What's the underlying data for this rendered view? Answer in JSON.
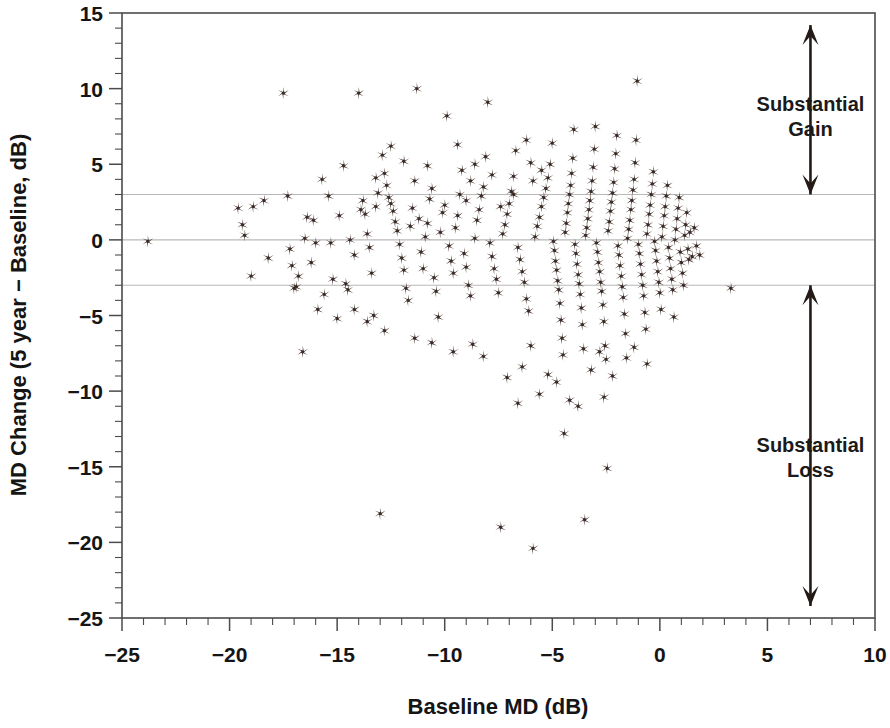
{
  "axes": {
    "x_label": "Baseline MD (dB)",
    "y_label": "MD Change (5 year − Baseline, dB)",
    "x_ticks": [
      "−25",
      "−20",
      "−15",
      "−10",
      "−5",
      "0",
      "5",
      "10"
    ],
    "y_ticks": [
      "15",
      "10",
      "5",
      "0",
      "−5",
      "−10",
      "−15",
      "−20",
      "−25"
    ]
  },
  "annotations": {
    "gain_line1": "Substantial",
    "gain_line2": "Gain",
    "loss_line1": "Substantial",
    "loss_line2": "Loss"
  },
  "colors": {
    "marker": "#3a2a26",
    "refline": "#b9b9b9",
    "frame": "#4b4b4b",
    "text": "#151515"
  },
  "chart_data": {
    "type": "scatter",
    "title": "",
    "xlabel": "Baseline MD (dB)",
    "ylabel": "MD Change (5 year − Baseline, dB)",
    "xlim": [
      -25,
      10
    ],
    "ylim": [
      -25,
      15
    ],
    "x_major_tick_step": 5,
    "x_minor_tick_step": 1,
    "y_major_tick_step": 5,
    "y_minor_tick_step": 1,
    "grid": false,
    "legend": "none",
    "marker_symbol": "asterisk",
    "marker_color": "#3a2a26",
    "reference_lines": [
      {
        "axis": "y",
        "value": 3,
        "color": "#b9b9b9"
      },
      {
        "axis": "y",
        "value": 0,
        "color": "#b9b9b9"
      },
      {
        "axis": "y",
        "value": -3,
        "color": "#b9b9b9"
      }
    ],
    "annotations": [
      {
        "text": "Substantial Gain",
        "x": 7.0,
        "y": 8.5,
        "arrow": "double",
        "arrow_from_y": 14.2,
        "arrow_to_y": 3.0
      },
      {
        "text": "Substantial Loss",
        "x": 7.0,
        "y": -14.0,
        "arrow": "double",
        "arrow_from_y": -3.0,
        "arrow_to_y": -24.2
      }
    ],
    "points": [
      [
        -23.8,
        -0.1
      ],
      [
        -19.6,
        2.1
      ],
      [
        -19.4,
        1.0
      ],
      [
        -19.3,
        0.3
      ],
      [
        -18.9,
        2.2
      ],
      [
        -18.4,
        2.6
      ],
      [
        -17.5,
        9.7
      ],
      [
        -17.3,
        2.9
      ],
      [
        -17.2,
        -0.6
      ],
      [
        -17.1,
        -1.7
      ],
      [
        -17.0,
        -3.2
      ],
      [
        -16.9,
        -3.1
      ],
      [
        -16.6,
        -7.4
      ],
      [
        -16.5,
        0.1
      ],
      [
        -16.4,
        1.5
      ],
      [
        -16.2,
        -1.5
      ],
      [
        -16.1,
        1.3
      ],
      [
        -16.0,
        -0.2
      ],
      [
        -15.9,
        -4.6
      ],
      [
        -15.7,
        4.0
      ],
      [
        -15.4,
        2.9
      ],
      [
        -15.3,
        -0.2
      ],
      [
        -15.2,
        -2.6
      ],
      [
        -15.0,
        -5.2
      ],
      [
        -14.9,
        1.6
      ],
      [
        -14.7,
        4.9
      ],
      [
        -14.6,
        -2.9
      ],
      [
        -14.5,
        -3.3
      ],
      [
        -14.4,
        0.0
      ],
      [
        -14.2,
        -1.0
      ],
      [
        -14.0,
        9.7
      ],
      [
        -13.9,
        2.0
      ],
      [
        -13.8,
        2.6
      ],
      [
        -13.7,
        1.7
      ],
      [
        -13.6,
        0.4
      ],
      [
        -13.5,
        -0.5
      ],
      [
        -13.4,
        -2.2
      ],
      [
        -13.3,
        -5.0
      ],
      [
        -13.2,
        2.2
      ],
      [
        -13.1,
        3.1
      ],
      [
        -13.0,
        -18.1
      ],
      [
        -12.9,
        5.6
      ],
      [
        -12.8,
        4.4
      ],
      [
        -12.7,
        3.6
      ],
      [
        -12.6,
        2.8
      ],
      [
        -12.5,
        2.4
      ],
      [
        -12.4,
        1.9
      ],
      [
        -12.3,
        1.2
      ],
      [
        -12.2,
        0.6
      ],
      [
        -12.1,
        -0.3
      ],
      [
        -12.0,
        -1.2
      ],
      [
        -11.9,
        -2.0
      ],
      [
        -11.8,
        -3.2
      ],
      [
        -11.7,
        -4.0
      ],
      [
        -11.6,
        0.9
      ],
      [
        -11.5,
        2.1
      ],
      [
        -11.4,
        3.9
      ],
      [
        -11.3,
        10.0
      ],
      [
        -11.2,
        1.4
      ],
      [
        -11.1,
        -0.8
      ],
      [
        -11.0,
        -1.9
      ],
      [
        -10.9,
        0.2
      ],
      [
        -10.8,
        1.1
      ],
      [
        -10.7,
        2.7
      ],
      [
        -10.6,
        3.4
      ],
      [
        -10.5,
        -2.5
      ],
      [
        -10.4,
        -3.4
      ],
      [
        -10.3,
        -5.1
      ],
      [
        -10.2,
        0.5
      ],
      [
        -10.1,
        1.8
      ],
      [
        -10.0,
        2.3
      ],
      [
        -9.9,
        8.2
      ],
      [
        -9.8,
        -0.4
      ],
      [
        -9.7,
        -1.4
      ],
      [
        -9.6,
        -2.2
      ],
      [
        -9.5,
        0.8
      ],
      [
        -9.4,
        1.6
      ],
      [
        -9.3,
        3.0
      ],
      [
        -9.2,
        4.6
      ],
      [
        -9.1,
        -0.9
      ],
      [
        -9.0,
        -1.8
      ],
      [
        -8.9,
        -3.0
      ],
      [
        -8.8,
        -3.7
      ],
      [
        -8.7,
        -6.9
      ],
      [
        -8.6,
        0.1
      ],
      [
        -8.5,
        1.3
      ],
      [
        -8.4,
        2.0
      ],
      [
        -8.3,
        2.9
      ],
      [
        -8.2,
        3.5
      ],
      [
        -8.1,
        5.5
      ],
      [
        -8.0,
        9.1
      ],
      [
        -7.9,
        -0.2
      ],
      [
        -7.8,
        -1.1
      ],
      [
        -7.7,
        -1.9
      ],
      [
        -7.6,
        -2.6
      ],
      [
        -7.5,
        -3.5
      ],
      [
        -7.4,
        -19.0
      ],
      [
        -7.3,
        0.4
      ],
      [
        -7.2,
        1.0
      ],
      [
        -7.1,
        1.7
      ],
      [
        -7.0,
        2.4
      ],
      [
        -6.9,
        3.2
      ],
      [
        -6.8,
        4.2
      ],
      [
        -6.7,
        5.9
      ],
      [
        -6.6,
        -0.5
      ],
      [
        -6.5,
        -1.3
      ],
      [
        -6.4,
        -2.1
      ],
      [
        -6.3,
        -2.8
      ],
      [
        -6.2,
        -3.9
      ],
      [
        -6.1,
        -4.7
      ],
      [
        -6.0,
        -7.0
      ],
      [
        -5.9,
        -20.4
      ],
      [
        -5.8,
        0.2
      ],
      [
        -5.7,
        0.9
      ],
      [
        -5.6,
        1.5
      ],
      [
        -5.5,
        2.2
      ],
      [
        -5.4,
        2.8
      ],
      [
        -5.3,
        3.4
      ],
      [
        -5.2,
        4.1
      ],
      [
        -5.1,
        5.0
      ],
      [
        -5.0,
        6.4
      ],
      [
        -4.95,
        -0.1
      ],
      [
        -4.9,
        -0.7
      ],
      [
        -4.85,
        -1.4
      ],
      [
        -4.8,
        -2.0
      ],
      [
        -4.75,
        -2.7
      ],
      [
        -4.7,
        -3.3
      ],
      [
        -4.65,
        -4.2
      ],
      [
        -4.6,
        -5.3
      ],
      [
        -4.55,
        -6.5
      ],
      [
        -4.5,
        -7.6
      ],
      [
        -4.45,
        -12.8
      ],
      [
        -4.4,
        0.5
      ],
      [
        -4.35,
        1.1
      ],
      [
        -4.3,
        1.8
      ],
      [
        -4.25,
        2.4
      ],
      [
        -4.2,
        3.0
      ],
      [
        -4.15,
        3.6
      ],
      [
        -4.1,
        4.4
      ],
      [
        -4.05,
        5.4
      ],
      [
        -4.0,
        7.3
      ],
      [
        -3.95,
        -0.3
      ],
      [
        -3.9,
        -0.9
      ],
      [
        -3.85,
        -1.6
      ],
      [
        -3.8,
        -2.3
      ],
      [
        -3.75,
        -2.9
      ],
      [
        -3.7,
        -3.6
      ],
      [
        -3.65,
        -4.5
      ],
      [
        -3.6,
        -5.6
      ],
      [
        -3.55,
        -7.2
      ],
      [
        -3.5,
        -18.5
      ],
      [
        -3.45,
        0.3
      ],
      [
        -3.4,
        0.8
      ],
      [
        -3.35,
        1.4
      ],
      [
        -3.3,
        2.0
      ],
      [
        -3.25,
        2.6
      ],
      [
        -3.2,
        3.2
      ],
      [
        -3.15,
        3.9
      ],
      [
        -3.1,
        4.8
      ],
      [
        -3.05,
        6.0
      ],
      [
        -3.0,
        7.5
      ],
      [
        -2.95,
        -0.2
      ],
      [
        -2.9,
        -0.8
      ],
      [
        -2.85,
        -1.5
      ],
      [
        -2.8,
        -2.1
      ],
      [
        -2.75,
        -2.8
      ],
      [
        -2.7,
        -3.4
      ],
      [
        -2.65,
        -4.3
      ],
      [
        -2.6,
        -5.4
      ],
      [
        -2.55,
        -7.0
      ],
      [
        -2.5,
        -7.9
      ],
      [
        -2.45,
        -15.1
      ],
      [
        -2.4,
        0.6
      ],
      [
        -2.35,
        1.2
      ],
      [
        -2.3,
        1.9
      ],
      [
        -2.25,
        2.5
      ],
      [
        -2.2,
        3.1
      ],
      [
        -2.15,
        3.8
      ],
      [
        -2.1,
        4.7
      ],
      [
        -2.05,
        5.7
      ],
      [
        -2.0,
        6.9
      ],
      [
        -1.95,
        -0.4
      ],
      [
        -1.9,
        -1.0
      ],
      [
        -1.85,
        -1.7
      ],
      [
        -1.8,
        -2.4
      ],
      [
        -1.75,
        -3.1
      ],
      [
        -1.7,
        -3.8
      ],
      [
        -1.65,
        -4.9
      ],
      [
        -1.6,
        -6.2
      ],
      [
        -1.55,
        -7.8
      ],
      [
        -1.5,
        0.1
      ],
      [
        -1.45,
        0.7
      ],
      [
        -1.4,
        1.3
      ],
      [
        -1.35,
        2.0
      ],
      [
        -1.3,
        2.6
      ],
      [
        -1.25,
        3.3
      ],
      [
        -1.2,
        4.0
      ],
      [
        -1.15,
        5.1
      ],
      [
        -1.1,
        6.6
      ],
      [
        -1.05,
        10.5
      ],
      [
        -1.0,
        -0.3
      ],
      [
        -0.95,
        -0.9
      ],
      [
        -0.9,
        -1.6
      ],
      [
        -0.85,
        -2.3
      ],
      [
        -0.8,
        -3.0
      ],
      [
        -0.75,
        -3.7
      ],
      [
        -0.7,
        -4.8
      ],
      [
        -0.65,
        -5.9
      ],
      [
        -0.6,
        0.4
      ],
      [
        -0.55,
        1.0
      ],
      [
        -0.5,
        1.7
      ],
      [
        -0.45,
        2.3
      ],
      [
        -0.4,
        3.0
      ],
      [
        -0.35,
        3.7
      ],
      [
        -0.3,
        4.5
      ],
      [
        -0.25,
        -0.1
      ],
      [
        -0.2,
        -0.7
      ],
      [
        -0.15,
        -1.4
      ],
      [
        -0.1,
        -2.1
      ],
      [
        -0.05,
        -2.8
      ],
      [
        0.0,
        -3.5
      ],
      [
        0.05,
        -4.6
      ],
      [
        0.1,
        0.2
      ],
      [
        0.15,
        0.9
      ],
      [
        0.2,
        1.6
      ],
      [
        0.25,
        2.2
      ],
      [
        0.3,
        2.9
      ],
      [
        0.35,
        3.6
      ],
      [
        0.4,
        -0.5
      ],
      [
        0.45,
        -1.2
      ],
      [
        0.5,
        -1.9
      ],
      [
        0.55,
        -2.6
      ],
      [
        0.6,
        -3.3
      ],
      [
        0.65,
        -5.1
      ],
      [
        0.7,
        0.0
      ],
      [
        0.75,
        0.7
      ],
      [
        0.8,
        1.4
      ],
      [
        0.85,
        2.1
      ],
      [
        0.9,
        2.8
      ],
      [
        0.95,
        -0.8
      ],
      [
        1.0,
        -1.5
      ],
      [
        1.05,
        -2.2
      ],
      [
        1.1,
        -3.0
      ],
      [
        1.15,
        0.3
      ],
      [
        1.2,
        1.0
      ],
      [
        1.25,
        1.8
      ],
      [
        1.3,
        -0.6
      ],
      [
        1.35,
        -1.3
      ],
      [
        1.4,
        0.5
      ],
      [
        1.5,
        -1.1
      ],
      [
        1.6,
        0.8
      ],
      [
        1.7,
        -0.4
      ],
      [
        1.85,
        -1.0
      ],
      [
        3.3,
        -3.2
      ],
      [
        -6.2,
        6.6
      ],
      [
        -6.0,
        5.1
      ],
      [
        -5.5,
        4.6
      ],
      [
        -7.8,
        4.3
      ],
      [
        -8.6,
        5.0
      ],
      [
        -9.4,
        6.3
      ],
      [
        -10.8,
        4.9
      ],
      [
        -11.9,
        5.2
      ],
      [
        -12.5,
        6.2
      ],
      [
        -13.2,
        4.1
      ],
      [
        -5.2,
        -8.9
      ],
      [
        -4.8,
        -9.4
      ],
      [
        -6.4,
        -8.4
      ],
      [
        -7.1,
        -9.1
      ],
      [
        -3.2,
        -8.6
      ],
      [
        -2.2,
        -9.0
      ],
      [
        -2.8,
        -7.4
      ],
      [
        -1.2,
        -7.1
      ],
      [
        -0.6,
        -8.2
      ],
      [
        -8.2,
        -7.7
      ],
      [
        -9.6,
        -7.4
      ],
      [
        -10.6,
        -6.8
      ],
      [
        -11.4,
        -6.5
      ],
      [
        -12.8,
        -6.0
      ],
      [
        -13.6,
        -5.4
      ],
      [
        -14.2,
        -4.6
      ],
      [
        -15.6,
        -3.6
      ],
      [
        -16.8,
        -2.4
      ],
      [
        -18.2,
        -1.2
      ],
      [
        -19.0,
        -2.4
      ],
      [
        -5.9,
        3.9
      ],
      [
        -6.8,
        3.0
      ],
      [
        -7.4,
        2.2
      ],
      [
        -8.8,
        3.9
      ],
      [
        -9.0,
        2.6
      ],
      [
        -4.2,
        -10.6
      ],
      [
        -5.6,
        -10.2
      ],
      [
        -3.8,
        -11.0
      ],
      [
        -2.6,
        -10.4
      ],
      [
        -6.6,
        -10.8
      ]
    ]
  }
}
